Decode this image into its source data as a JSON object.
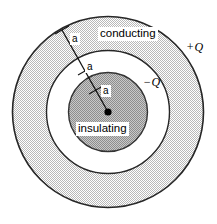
{
  "figure": {
    "center": {
      "x": 108,
      "y": 112
    },
    "radii": {
      "inner_sphere": 40,
      "shell_inner": 62,
      "shell_outer": 96
    },
    "colors": {
      "stroke": "#1a1a1a",
      "shell_fill": "#e3e3e3",
      "inner_sphere_fill": "#b0b0b0",
      "gap_fill": "#ffffff",
      "center_dot": "#000000",
      "background": "#ffffff"
    },
    "radial_line": {
      "from": {
        "x": 108,
        "y": 112
      },
      "to": {
        "x": 62,
        "y": 30
      }
    },
    "tick_marks": [
      {
        "x1": 55,
        "y1": 34,
        "x2": 69,
        "y2": 26
      },
      {
        "x1": 78,
        "y1": 75,
        "x2": 92,
        "y2": 67
      },
      {
        "x1": 89,
        "y1": 94,
        "x2": 103,
        "y2": 86
      }
    ]
  },
  "labels": {
    "conducting": "conducting",
    "insulating": "insulating",
    "outer_charge": "+Q",
    "inner_charge": "−Q",
    "radius_outer": "a",
    "radius_mid": "a",
    "radius_inner": "a"
  }
}
